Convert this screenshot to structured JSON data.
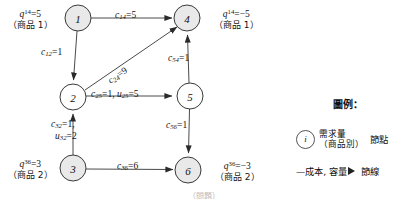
{
  "figure": {
    "type": "network-flow-diagram",
    "bottom_caption": "（問題）"
  },
  "nodes": [
    {
      "id": "1",
      "label": "1",
      "cx": 78,
      "cy": 18,
      "r": 13,
      "filled": true
    },
    {
      "id": "4",
      "label": "4",
      "cx": 187,
      "cy": 18,
      "r": 13,
      "filled": true
    },
    {
      "id": "2",
      "label": "2",
      "cx": 73,
      "cy": 97,
      "r": 13,
      "filled": false
    },
    {
      "id": "5",
      "label": "5",
      "cx": 190,
      "cy": 96,
      "r": 13,
      "filled": false
    },
    {
      "id": "3",
      "label": "3",
      "cx": 73,
      "cy": 168,
      "r": 13,
      "filled": true
    },
    {
      "id": "6",
      "label": "6",
      "cx": 188,
      "cy": 170,
      "r": 13,
      "filled": true
    }
  ],
  "edges": [
    {
      "id": "e14",
      "from": "1",
      "to": "4",
      "cost": "5",
      "label_c": "c",
      "label_sub": "14",
      "text": "c14=5"
    },
    {
      "id": "e12",
      "from": "1",
      "to": "2",
      "cost": "1",
      "label_c": "c",
      "label_sub": "12",
      "text": "c12=1"
    },
    {
      "id": "e24",
      "from": "2",
      "to": "4",
      "cost": "9",
      "label_c": "c",
      "label_sub": "24",
      "text": "c24=9"
    },
    {
      "id": "e25",
      "from": "2",
      "to": "5",
      "cost": "1",
      "capacity": "5",
      "text": "c25=1, u25=5"
    },
    {
      "id": "e54",
      "from": "5",
      "to": "4",
      "cost": "1",
      "text": "c54=1"
    },
    {
      "id": "e32",
      "from": "3",
      "to": "2",
      "cost": "1",
      "capacity": "2",
      "text": "c32=1, u32=2"
    },
    {
      "id": "e56",
      "from": "5",
      "to": "6",
      "cost": "1",
      "text": "c56=1"
    },
    {
      "id": "e36",
      "from": "3",
      "to": "6",
      "cost": "6",
      "text": "c36=6"
    }
  ],
  "supply_labels": [
    {
      "id": "q14-source",
      "node": "1",
      "q_symbol": "q",
      "superscript": "14",
      "value": "=5",
      "commodity": "（商品 1）",
      "x": 8,
      "y": 6
    },
    {
      "id": "q14-sink",
      "node": "4",
      "q_symbol": "q",
      "superscript": "14",
      "value": "=−5",
      "commodity": "（商品 1）",
      "x": 214,
      "y": 6
    },
    {
      "id": "q36-source",
      "node": "3",
      "q_symbol": "q",
      "superscript": "36",
      "value": "=3",
      "commodity": "（商品 2）",
      "x": 8,
      "y": 156
    },
    {
      "id": "q36-sink",
      "node": "6",
      "q_symbol": "q",
      "superscript": "36",
      "value": "=−3",
      "commodity": "（商品 2）",
      "x": 215,
      "y": 158
    }
  ],
  "legend": {
    "title": "圖例：",
    "node_entry": {
      "symbol": "i",
      "line1": "需求量",
      "line2": "（商品別）",
      "term": "節點"
    },
    "edge_entry": {
      "label": "—成本, 容量",
      "term": "節線"
    }
  },
  "colors": {
    "node_fill_shaded": "#e9e9e9",
    "node_fill_hollow": "#ffffff",
    "stroke": "#3a3a3a",
    "text": "#141414",
    "background": "#ffffff"
  }
}
